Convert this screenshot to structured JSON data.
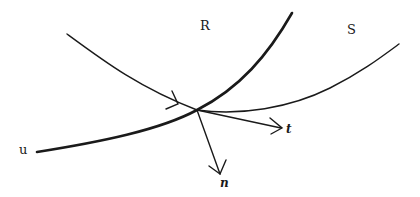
{
  "diagram": {
    "type": "curve-intersection",
    "labels": {
      "region_r": "R",
      "region_s": "S",
      "curve_u": "u",
      "tangent": "t",
      "normal": "n"
    },
    "colors": {
      "stroke": "#1a1a1a",
      "background": "#ffffff"
    },
    "elements": [
      {
        "id": "curve-u",
        "description": "thick curve labeled u, rising steeply to the upper right"
      },
      {
        "id": "curve-incoming",
        "description": "thin curve from upper left with arrowhead, meeting intersection point"
      },
      {
        "id": "curve-s",
        "description": "thin curve continuing from intersection toward upper right into region S"
      },
      {
        "id": "vector-t",
        "description": "tangent vector arrow t"
      },
      {
        "id": "vector-n",
        "description": "normal vector arrow n"
      }
    ]
  }
}
